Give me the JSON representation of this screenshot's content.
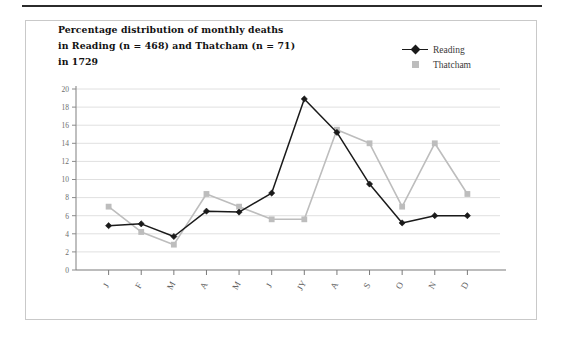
{
  "figure": {
    "title_lines": [
      "Percentage distribution of monthly deaths",
      "in Reading (n = 468) and Thatcham (n = 71)",
      "in 1729"
    ],
    "title_full": "Percentage distribution of monthly deaths in Reading (n = 468) and Thatcham (n = 71) in 1729"
  },
  "legend": {
    "position": "top-right",
    "entries": [
      {
        "label": "Reading",
        "color": "#1a1a1a",
        "marker": "diamond"
      },
      {
        "label": "Thatcham",
        "color": "#bdbdbd",
        "marker": "square"
      }
    ]
  },
  "chart_data": {
    "type": "line",
    "title": "Percentage distribution of monthly deaths in Reading (n = 468) and Thatcham (n = 71) in 1729",
    "xlabel": "",
    "ylabel": "",
    "categories": [
      "J",
      "F",
      "M",
      "A",
      "M",
      "J",
      "JY",
      "A",
      "S",
      "O",
      "N",
      "D"
    ],
    "category_names": [
      "January",
      "February",
      "March",
      "April",
      "May",
      "June",
      "July",
      "August",
      "September",
      "October",
      "November",
      "December"
    ],
    "ylim": [
      0,
      20
    ],
    "yticks": [
      0,
      2,
      4,
      6,
      8,
      10,
      12,
      14,
      16,
      18,
      20
    ],
    "grid": true,
    "legend_position": "top-right",
    "series": [
      {
        "name": "Reading",
        "color": "#1a1a1a",
        "marker": "diamond",
        "values": [
          4.9,
          5.1,
          3.7,
          6.5,
          6.4,
          8.5,
          18.9,
          15.2,
          9.5,
          5.2,
          6.0,
          6.0
        ]
      },
      {
        "name": "Thatcham",
        "color": "#bdbdbd",
        "marker": "square",
        "values": [
          7.0,
          4.2,
          2.8,
          8.4,
          7.0,
          5.6,
          5.6,
          15.5,
          14.0,
          7.0,
          14.0,
          8.4
        ]
      }
    ]
  },
  "colors": {
    "reading": "#1a1a1a",
    "thatcham": "#bdbdbd",
    "grid": "#e0e0e0",
    "axis": "#8a8a8a",
    "box_border": "#c9c9c9",
    "top_rule": "#2b2b2b"
  }
}
